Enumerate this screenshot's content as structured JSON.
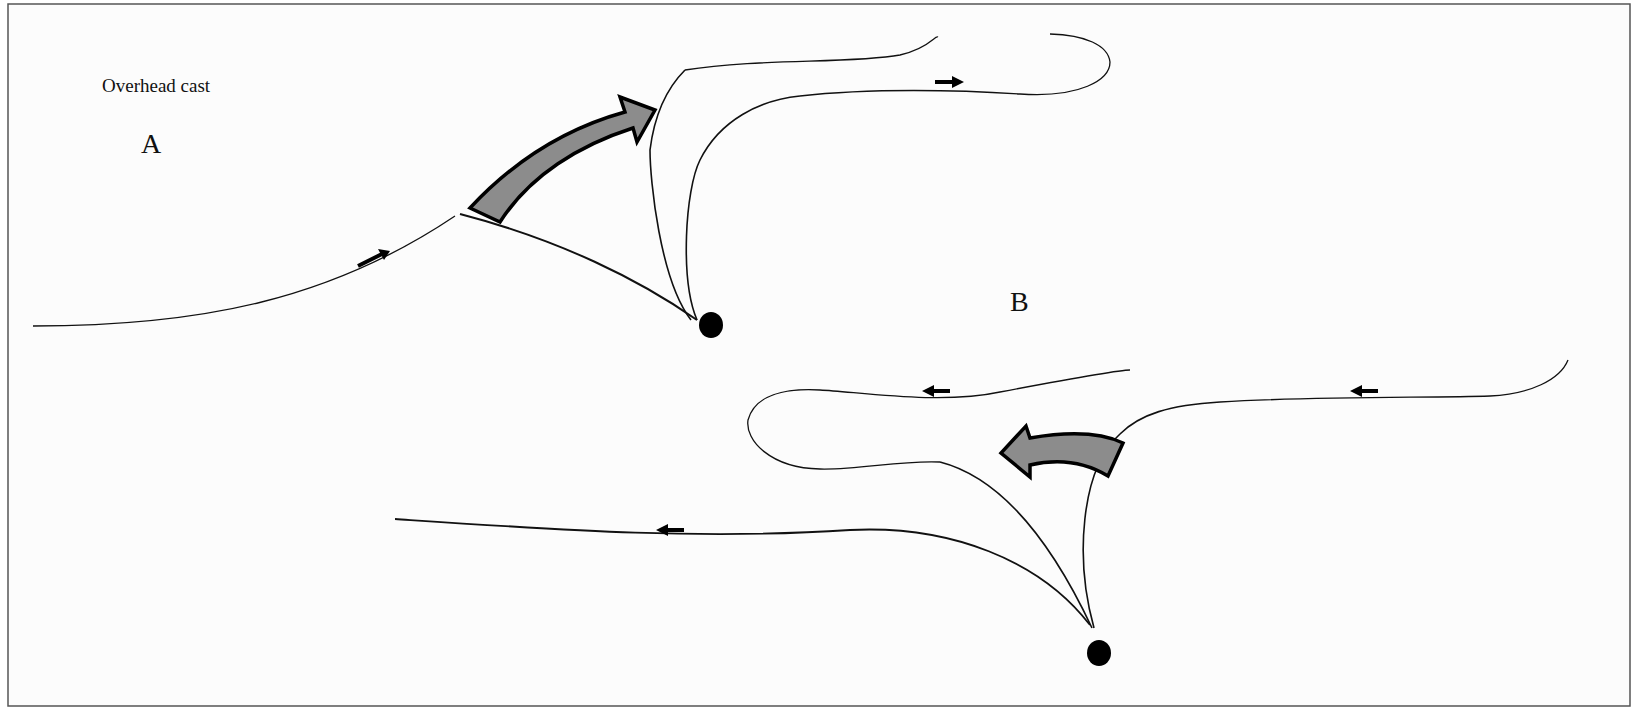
{
  "figure": {
    "title": "Overhead cast",
    "panel_a_label": "A",
    "panel_b_label": "B"
  },
  "colors": {
    "background": "#fcfcfc",
    "border": "#555555",
    "line": "#111111",
    "motion_arrow_fill": "#8c8c8c",
    "rod_tip": "#000000"
  },
  "panels": [
    {
      "id": "A",
      "description": "Forward-to-back cast: line lifted and looping backward",
      "small_arrows": [
        "right-up",
        "right"
      ],
      "big_arrow_direction": "up-right"
    },
    {
      "id": "B",
      "description": "Back-to-forward cast: line looping forward",
      "small_arrows": [
        "left",
        "left",
        "left"
      ],
      "big_arrow_direction": "left"
    }
  ]
}
